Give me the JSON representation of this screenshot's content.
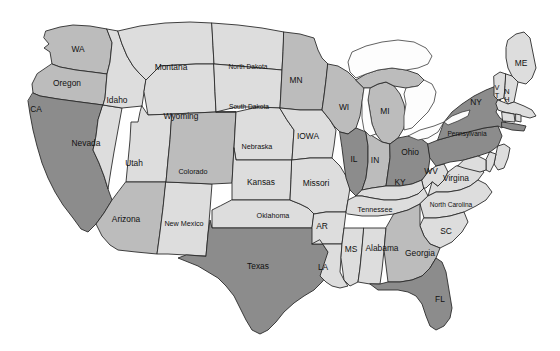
{
  "map": {
    "title": "United States choropleth map",
    "background_color": "#ffffff",
    "border_color": "#2b2b2b",
    "lake_color": "#fdfdfd",
    "shade_levels": {
      "dark": "#8c8c8c",
      "medium": "#bcbcbc",
      "light": "#dddddd"
    },
    "states": [
      {
        "code": "WA",
        "label": "WA",
        "shade": "medium",
        "label_x": 78,
        "label_y": 50
      },
      {
        "code": "OR",
        "label": "Oregon",
        "shade": "medium",
        "label_x": 67,
        "label_y": 84
      },
      {
        "code": "CA",
        "label": "CA",
        "shade": "dark",
        "label_x": 36,
        "label_y": 110
      },
      {
        "code": "NV",
        "label": "Nevada",
        "shade": "light",
        "label_x": 86,
        "label_y": 144
      },
      {
        "code": "ID",
        "label": "Idaho",
        "shade": "light",
        "label_x": 117,
        "label_y": 101
      },
      {
        "code": "MT",
        "label": "Montana",
        "shade": "light",
        "label_x": 171,
        "label_y": 68
      },
      {
        "code": "WY",
        "label": "Wyoming",
        "shade": "light",
        "label_x": 181,
        "label_y": 117
      },
      {
        "code": "UT",
        "label": "Utah",
        "shade": "light",
        "label_x": 134,
        "label_y": 164
      },
      {
        "code": "AZ",
        "label": "Arizona",
        "shade": "medium",
        "label_x": 126,
        "label_y": 220
      },
      {
        "code": "NM",
        "label": "New Mexico",
        "shade": "light",
        "label_x": 184,
        "label_y": 224
      },
      {
        "code": "CO",
        "label": "Colorado",
        "shade": "medium",
        "label_x": 193,
        "label_y": 172
      },
      {
        "code": "ND",
        "label": "North Dakota",
        "shade": "light",
        "label_x": 248,
        "label_y": 67
      },
      {
        "code": "SD",
        "label": "South Dakota",
        "shade": "light",
        "label_x": 249,
        "label_y": 107
      },
      {
        "code": "NE",
        "label": "Nebraska",
        "shade": "light",
        "label_x": 257,
        "label_y": 147
      },
      {
        "code": "KS",
        "label": "Kansas",
        "shade": "light",
        "label_x": 261,
        "label_y": 183
      },
      {
        "code": "OK",
        "label": "Oklahoma",
        "shade": "light",
        "label_x": 273,
        "label_y": 216
      },
      {
        "code": "TX",
        "label": "Texas",
        "shade": "dark",
        "label_x": 258,
        "label_y": 267
      },
      {
        "code": "MN",
        "label": "MN",
        "shade": "medium",
        "label_x": 296,
        "label_y": 81
      },
      {
        "code": "IA",
        "label": "IOWA",
        "shade": "light",
        "label_x": 308,
        "label_y": 137
      },
      {
        "code": "MO",
        "label": "Missori",
        "shade": "light",
        "label_x": 316,
        "label_y": 184
      },
      {
        "code": "AR",
        "label": "AR",
        "shade": "light",
        "label_x": 322,
        "label_y": 227
      },
      {
        "code": "LA",
        "label": "LA",
        "shade": "light",
        "label_x": 323,
        "label_y": 268
      },
      {
        "code": "MS",
        "label": "MS",
        "shade": "light",
        "label_x": 351,
        "label_y": 250
      },
      {
        "code": "AL",
        "label": "Alabama",
        "shade": "light",
        "label_x": 382,
        "label_y": 249
      },
      {
        "code": "WI",
        "label": "WI",
        "shade": "medium",
        "label_x": 344,
        "label_y": 108
      },
      {
        "code": "MI",
        "label": "MI",
        "shade": "medium",
        "label_x": 385,
        "label_y": 112
      },
      {
        "code": "IL",
        "label": "IL",
        "shade": "dark",
        "label_x": 354,
        "label_y": 160
      },
      {
        "code": "IN",
        "label": "IN",
        "shade": "medium",
        "label_x": 375,
        "label_y": 161
      },
      {
        "code": "OH",
        "label": "Ohio",
        "shade": "dark",
        "label_x": 410,
        "label_y": 153
      },
      {
        "code": "KY",
        "label": "KY",
        "shade": "light",
        "label_x": 400,
        "label_y": 183
      },
      {
        "code": "TN",
        "label": "Tennessee",
        "shade": "light",
        "label_x": 375,
        "label_y": 210
      },
      {
        "code": "WV",
        "label": "WV",
        "shade": "light",
        "label_x": 431,
        "label_y": 172
      },
      {
        "code": "VA",
        "label": "Virgina",
        "shade": "light",
        "label_x": 456,
        "label_y": 179
      },
      {
        "code": "NC",
        "label": "North Carolina",
        "shade": "light",
        "label_x": 451,
        "label_y": 205
      },
      {
        "code": "SC",
        "label": "SC",
        "shade": "light",
        "label_x": 446,
        "label_y": 232
      },
      {
        "code": "GA",
        "label": "Georgia",
        "shade": "medium",
        "label_x": 420,
        "label_y": 254
      },
      {
        "code": "FL",
        "label": "FL",
        "shade": "dark",
        "label_x": 440,
        "label_y": 300
      },
      {
        "code": "PA",
        "label": "Pennsylvania",
        "shade": "dark",
        "label_x": 467,
        "label_y": 134
      },
      {
        "code": "NY",
        "label": "NY",
        "shade": "dark",
        "label_x": 476,
        "label_y": 103
      },
      {
        "code": "ME",
        "label": "ME",
        "shade": "light",
        "label_x": 521,
        "label_y": 64
      },
      {
        "code": "VT",
        "label": "VT",
        "shade": "light",
        "label_x": 497,
        "label_y": 88
      },
      {
        "code": "NH",
        "label": "NH",
        "shade": "light",
        "label_x": 507,
        "label_y": 92
      }
    ],
    "lakes": [
      {
        "name": "great-lakes"
      }
    ]
  }
}
